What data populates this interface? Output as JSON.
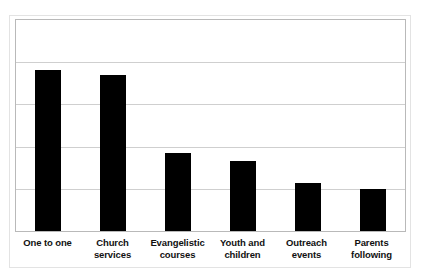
{
  "chart_data": {
    "type": "bar",
    "title": "",
    "subtitle": "",
    "xlabel": "",
    "ylabel": "",
    "categories": [
      "One to one",
      "Church services",
      "Evangelistic courses",
      "Youth and children",
      "Outreach events",
      "Parents following"
    ],
    "category_lines": [
      [
        "One to one"
      ],
      [
        "Church",
        "services"
      ],
      [
        "Evangelistic",
        "courses"
      ],
      [
        "Youth and",
        "children"
      ],
      [
        "Outreach",
        "events"
      ],
      [
        "Parents",
        "following"
      ]
    ],
    "values": [
      3.82,
      3.7,
      1.86,
      1.65,
      1.13,
      0.99
    ],
    "ylim": [
      0,
      5
    ],
    "gridlines": [
      1,
      2,
      3,
      4
    ],
    "tick_labels": [],
    "grid": true,
    "legend": false,
    "legend_position": "none",
    "series": [
      {
        "name": "Responses",
        "values": [
          3.82,
          3.7,
          1.86,
          1.65,
          1.13,
          0.99
        ]
      }
    ]
  },
  "style": {
    "bar_color": "#000000",
    "grid_color": "#cfcfcf",
    "frame_color": "#b9b9b9",
    "card_border_color": "#e3e3e3",
    "background": "#ffffff",
    "label_color": "#111111"
  }
}
